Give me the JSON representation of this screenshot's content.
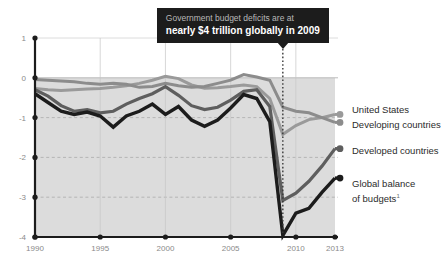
{
  "chart_data": {
    "type": "line",
    "title": "",
    "xlabel": "",
    "ylabel": "",
    "xlim": [
      1990,
      2013
    ],
    "ylim": [
      -4,
      1
    ],
    "yticks": [
      1,
      0,
      -1,
      -2,
      -3,
      -4
    ],
    "ytick_labels": [
      "1",
      "0",
      "-1",
      "-2",
      "-3",
      "-4"
    ],
    "xticks": [
      1990,
      1995,
      2000,
      2005,
      2010,
      2013
    ],
    "xtick_labels": [
      "1990",
      "1995",
      "2000",
      "2005",
      "2010",
      "2013"
    ],
    "grid": "horizontal-dashed",
    "legend_position": "right-inline",
    "zero_shading": "light-gray below zero",
    "x": [
      1990,
      1991,
      1992,
      1993,
      1994,
      1995,
      1996,
      1997,
      1998,
      1999,
      2000,
      2001,
      2002,
      2003,
      2004,
      2005,
      2006,
      2007,
      2008,
      2009,
      2010,
      2011,
      2012,
      2013
    ],
    "series": [
      {
        "name": "United States",
        "color": "#9a9a9a",
        "values": [
          -0.27,
          -0.3,
          -0.32,
          -0.3,
          -0.28,
          -0.27,
          -0.24,
          -0.2,
          -0.14,
          -0.06,
          0.04,
          -0.02,
          -0.18,
          -0.26,
          -0.25,
          -0.22,
          -0.18,
          -0.22,
          -0.52,
          -1.42,
          -1.2,
          -1.05,
          -1.0,
          -0.92
        ]
      },
      {
        "name": "Developing countries",
        "color": "#8c8c8c",
        "values": [
          -0.04,
          -0.06,
          -0.08,
          -0.1,
          -0.14,
          -0.16,
          -0.14,
          -0.16,
          -0.24,
          -0.22,
          -0.14,
          -0.2,
          -0.24,
          -0.22,
          -0.14,
          -0.06,
          0.08,
          0.02,
          -0.06,
          -0.74,
          -0.84,
          -0.88,
          -1.0,
          -1.12
        ]
      },
      {
        "name": "Developed countries",
        "color": "#5e5e5e",
        "values": [
          -0.3,
          -0.46,
          -0.7,
          -0.84,
          -0.8,
          -0.88,
          -0.84,
          -0.66,
          -0.52,
          -0.4,
          -0.22,
          -0.44,
          -0.7,
          -0.8,
          -0.74,
          -0.56,
          -0.34,
          -0.3,
          -0.72,
          -3.08,
          -2.9,
          -2.6,
          -2.22,
          -1.78
        ]
      },
      {
        "name": "Global balance of budgets",
        "color": "#1c1c1c",
        "values": [
          -0.4,
          -0.62,
          -0.84,
          -0.92,
          -0.86,
          -0.96,
          -1.24,
          -0.96,
          -0.84,
          -0.66,
          -0.92,
          -0.72,
          -1.06,
          -1.22,
          -1.06,
          -0.76,
          -0.42,
          -0.52,
          -1.1,
          -3.96,
          -3.4,
          -3.28,
          -2.88,
          -2.52
        ]
      }
    ]
  },
  "callout": {
    "line1": "Government budget deficits are at",
    "line2": "nearly $4 trillion globally in 2009",
    "points_to_year": 2009
  },
  "legend": [
    {
      "label": "United States",
      "color": "#9a9a9a"
    },
    {
      "label": "Developing countries",
      "color": "#8c8c8c"
    },
    {
      "label": "Developed countries",
      "color": "#5e5e5e"
    },
    {
      "label": "Global balance",
      "label2": "of budgets",
      "footnote_marker": "1",
      "color": "#1c1c1c"
    }
  ]
}
